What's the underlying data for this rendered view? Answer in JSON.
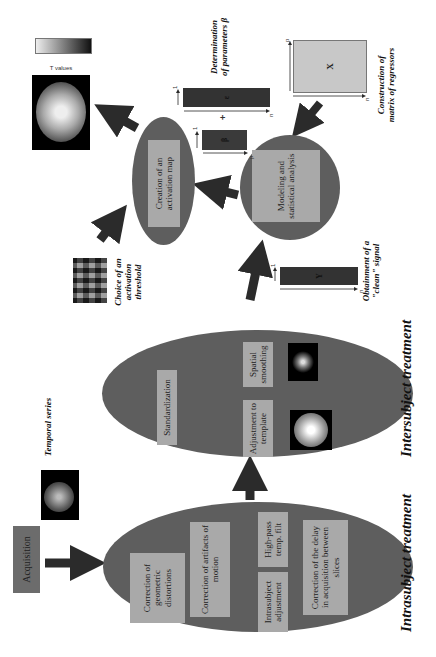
{
  "diagram": {
    "orientation": "rotated 90 degrees counter-clockwise",
    "acquisition": {
      "label": "Acquisition"
    },
    "temporal_series": {
      "caption": "Temporal series"
    },
    "intrasubject": {
      "caption": "Intrasubject treatment",
      "steps": {
        "geometric": "Correction of geometric distortions",
        "motion": "Correction of artifacts of motion",
        "intrasubject_adjustment": "Intrasubject adjustment",
        "highpass": "High-pass temp. filt",
        "slice_timing": "Correction of the delay in acquisition between slices"
      }
    },
    "intersubject": {
      "caption": "Intersubject treatment",
      "steps": {
        "standardization": "Standardization",
        "template": "Adjustment to template",
        "smoothing": "Spatial smoothing"
      }
    },
    "clean_signal": {
      "caption": "Obtainment of a \"clean\" signal",
      "vector_label": "Y",
      "dim_rows": "n",
      "dim_cols": "1"
    },
    "regressors": {
      "caption": "Construction of matrix of regressors",
      "matrix_label": "X",
      "dim_rows": "n",
      "dim_cols": "p"
    },
    "parameters": {
      "caption": "Determination of parameters β",
      "beta_label": "β",
      "beta_rows": "p",
      "beta_cols": "1",
      "epsilon_label": "ε",
      "epsilon_rows": "n",
      "epsilon_cols": "1",
      "plus_sign": "+"
    },
    "modeling": {
      "label": "Modeling and statistical analysis"
    },
    "activation_map": {
      "label": "Creation of an activation map"
    },
    "threshold": {
      "caption": "Choice of an activation threshold"
    },
    "colorbar": {
      "label": "T values"
    }
  },
  "colors": {
    "ellipse_fill": "#5e5e5e",
    "box_fill": "#a9a9a9",
    "arrow": "#2b2b2b",
    "bar_fill": "#333333",
    "matrix_fill": "#c8c8c8"
  }
}
